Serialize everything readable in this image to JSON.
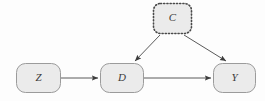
{
  "diagram": {
    "type": "causal-dag",
    "background_color": "#fdfdfd",
    "node_fill_color": "#ebebeb",
    "node_border_color": "#9b9b9b",
    "latent_border_color": "#4a4a4a",
    "edge_color": "#5a5a5a",
    "label_color": "#3a3a3a",
    "nodes": [
      {
        "id": "Z",
        "label": "Z",
        "style": "solid",
        "x": 16,
        "y": 63,
        "width": 44,
        "height": 29,
        "rx": 9
      },
      {
        "id": "D",
        "label": "D",
        "style": "solid",
        "x": 100,
        "y": 63,
        "width": 43,
        "height": 29,
        "rx": 9
      },
      {
        "id": "Y",
        "label": "Y",
        "style": "solid",
        "x": 213,
        "y": 63,
        "width": 42,
        "height": 29,
        "rx": 9
      },
      {
        "id": "C",
        "label": "C",
        "style": "dotted",
        "x": 153,
        "y": 3,
        "width": 38,
        "height": 30,
        "rx": 7
      }
    ],
    "edges": [
      {
        "id": "Z-to-D",
        "from": "Z",
        "to": "D",
        "x1": 61,
        "y1": 78,
        "x2": 98,
        "y2": 78,
        "arrowhead": "solid-triangle"
      },
      {
        "id": "D-to-Y",
        "from": "D",
        "to": "Y",
        "x1": 144,
        "y1": 78,
        "x2": 211,
        "y2": 78,
        "arrowhead": "solid-triangle"
      },
      {
        "id": "C-to-D",
        "from": "C",
        "to": "D",
        "x1": 160,
        "y1": 35,
        "x2": 135,
        "y2": 61,
        "arrowhead": "solid-triangle"
      },
      {
        "id": "C-to-Y",
        "from": "C",
        "to": "Y",
        "x1": 184,
        "y1": 35,
        "x2": 226,
        "y2": 61,
        "arrowhead": "solid-triangle"
      }
    ]
  }
}
